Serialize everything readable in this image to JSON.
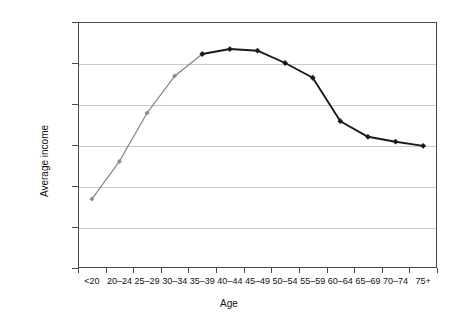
{
  "chart_data": {
    "type": "line",
    "title": "",
    "xlabel": "Age",
    "ylabel": "Average income",
    "categories": [
      "<20",
      "20–24",
      "25–29",
      "30–34",
      "35–39",
      "40–44",
      "45–49",
      "50–54",
      "55–59",
      "60–64",
      "65–69",
      "70–74",
      "75+"
    ],
    "values": [
      8400,
      13000,
      18900,
      23400,
      26100,
      26700,
      26500,
      25000,
      23200,
      17900,
      16000,
      15400,
      14900
    ],
    "series": [
      {
        "name": "Average income",
        "values": [
          8400,
          13000,
          18900,
          23400,
          26100,
          26700,
          26500,
          25000,
          23200,
          17900,
          16000,
          15400,
          14900
        ]
      }
    ],
    "segment_colors": {
      "early_segment_color": "#8c8c8c",
      "late_segment_color": "#1a1a1a",
      "color_change_index": 4
    },
    "ylim": [
      0,
      30000
    ],
    "y_ticks": [
      0,
      5000,
      10000,
      15000,
      20000,
      25000,
      30000
    ],
    "y_tick_labels": [
      "£0",
      "£5,000",
      "£10,000",
      "£15,000",
      "£20,000",
      "£25,000",
      "£30,000"
    ],
    "grid": true,
    "grid_axis": "y",
    "legend": false,
    "marker": "diamond",
    "axis_color": "#4a4a4a",
    "grid_color": "#c9c9c9",
    "background_color": "#ffffff"
  }
}
